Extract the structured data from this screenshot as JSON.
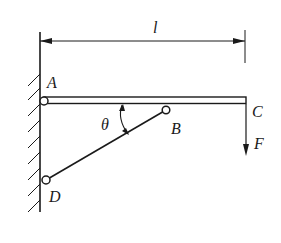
{
  "diagram": {
    "type": "statics-bracket",
    "colors": {
      "line": "#1a1a1a",
      "background": "#ffffff"
    },
    "labels": {
      "length": "l",
      "point_a": "A",
      "point_b": "B",
      "point_c": "C",
      "point_d": "D",
      "angle": "θ",
      "force": "F"
    },
    "elements": {
      "wall": "fixed wall with hatching",
      "beam": "horizontal beam AC",
      "strut": "two-force member DB",
      "pins": [
        "A",
        "B",
        "D"
      ],
      "load": "downward force F at C",
      "dimension": "length l from A to C"
    }
  }
}
